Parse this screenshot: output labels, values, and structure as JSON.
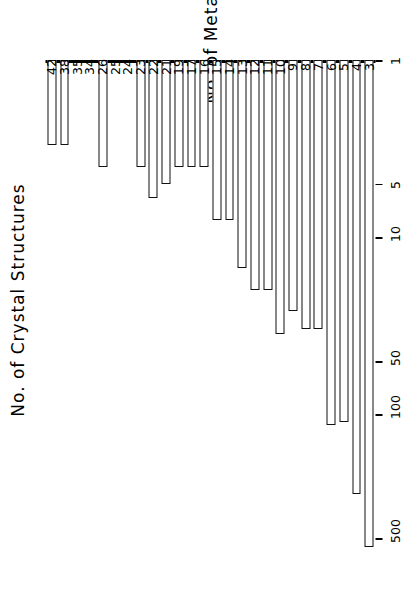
{
  "chart_data": {
    "type": "bar",
    "orientation": "horizontal-rotated",
    "title": "",
    "xlabel": "No. of Metal Atoms",
    "ylabel": "No. of Crystal Structures",
    "yscale": "log",
    "ylim": [
      1,
      700
    ],
    "ytick_labels": [
      "1",
      "5",
      "10",
      "50",
      "100",
      "500"
    ],
    "ytick_values": [
      1,
      5,
      10,
      50,
      100,
      500
    ],
    "grid": false,
    "legend": null,
    "categories": [
      "3",
      "4",
      "5",
      "6",
      "7",
      "8",
      "9",
      "10",
      "11",
      "12",
      "13",
      "14",
      "15",
      "16",
      "17",
      "19",
      "21",
      "22",
      "23",
      "24",
      "25",
      "26",
      "34",
      "35",
      "38",
      "42"
    ],
    "values": [
      560,
      280,
      110,
      115,
      33,
      33,
      26,
      35,
      20,
      20,
      15,
      8,
      8,
      4,
      4,
      4,
      5,
      6,
      4,
      1,
      1,
      4,
      1,
      1,
      3,
      3
    ],
    "series": [
      {
        "name": "No. of Crystal Structures",
        "values": [
          560,
          280,
          110,
          115,
          33,
          33,
          26,
          35,
          20,
          20,
          15,
          8,
          8,
          4,
          4,
          4,
          5,
          6,
          4,
          1,
          1,
          4,
          1,
          1,
          3,
          3
        ]
      }
    ],
    "bar_style": {
      "fill": "#ffffff",
      "edge": "#111111",
      "edge_width": 1.6
    },
    "colors": {
      "axis": "#000000",
      "text": "#000000",
      "background": "#ffffff"
    }
  }
}
